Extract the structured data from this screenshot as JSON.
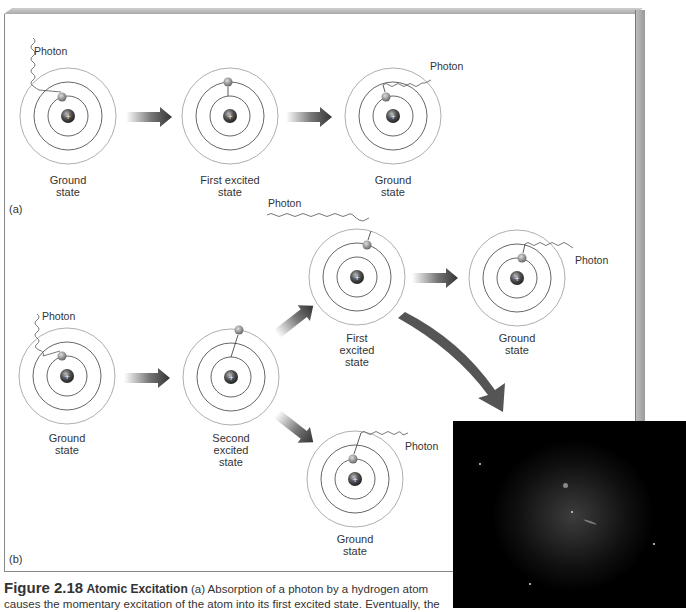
{
  "figure": {
    "number": "Figure 2.18",
    "title": "Atomic Excitation",
    "caption_text": "(a) Absorption of a photon by a hydrogen atom causes the momentary excitation of the atom into its first excited state. Eventually, the"
  },
  "panel_a": {
    "label": "(a)",
    "atoms": [
      {
        "state": "Ground\nstate",
        "line1": "Ground",
        "line2": "state",
        "photon": "Photon"
      },
      {
        "state": "First excited state",
        "line1": "First excited",
        "line2": "state"
      },
      {
        "state": "Ground state",
        "line1": "Ground",
        "line2": "state",
        "photon": "Photon"
      }
    ]
  },
  "panel_b": {
    "label": "(b)",
    "atoms": [
      {
        "line1": "Ground",
        "line2": "state",
        "photon": "Photon"
      },
      {
        "line1": "Second",
        "line2": "excited",
        "line3": "state"
      },
      {
        "line1": "First",
        "line2": "excited",
        "line3": "state",
        "photon": "Photon"
      },
      {
        "line1": "Ground",
        "line2": "state",
        "photon": "Photon"
      },
      {
        "line1": "Ground",
        "line2": "state",
        "photon": "Photon"
      }
    ]
  },
  "colors": {
    "orbit": "#555555",
    "outer_orbit": "#999999",
    "arrow_dark": "#333333",
    "panel_border": "#888888",
    "nebula_bg": "#000000"
  }
}
